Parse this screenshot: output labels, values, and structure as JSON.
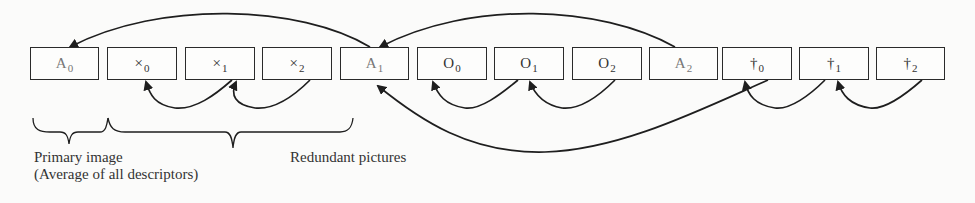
{
  "diagram": {
    "boxes": [
      {
        "id": "A0",
        "base": "A",
        "sub": "0",
        "left": 30
      },
      {
        "id": "x0",
        "base": "×",
        "sub": "0",
        "left": 107
      },
      {
        "id": "x1",
        "base": "×",
        "sub": "1",
        "left": 185
      },
      {
        "id": "x2",
        "base": "×",
        "sub": "2",
        "left": 262
      },
      {
        "id": "A1",
        "base": "A",
        "sub": "1",
        "left": 340
      },
      {
        "id": "o0",
        "base": "O",
        "sub": "0",
        "left": 417
      },
      {
        "id": "o1",
        "base": "O",
        "sub": "1",
        "left": 494
      },
      {
        "id": "o2",
        "base": "O",
        "sub": "2",
        "left": 572
      },
      {
        "id": "A2",
        "base": "A",
        "sub": "2",
        "left": 649
      },
      {
        "id": "t0",
        "base": "†",
        "sub": "0",
        "left": 726
      },
      {
        "id": "t1",
        "base": "†",
        "sub": "1",
        "left": 804
      },
      {
        "id": "t2",
        "base": "†",
        "sub": "2",
        "left": 876
      }
    ],
    "labels": {
      "primary_image": "Primary image",
      "primary_image_note": "(Average of all descriptors)",
      "redundant_pictures": "Redundant pictures"
    },
    "edges": [
      {
        "from": "A1",
        "to": "A0",
        "side": "top"
      },
      {
        "from": "A2",
        "to": "A1",
        "side": "top"
      },
      {
        "from": "x1",
        "to": "x0",
        "side": "bottom"
      },
      {
        "from": "x2",
        "to": "x1",
        "side": "bottom"
      },
      {
        "from": "o1",
        "to": "o0",
        "side": "bottom"
      },
      {
        "from": "o2",
        "to": "o1",
        "side": "bottom"
      },
      {
        "from": "t1",
        "to": "t0",
        "side": "bottom"
      },
      {
        "from": "t2",
        "to": "t1",
        "side": "bottom"
      },
      {
        "from": "t0",
        "to": "A1",
        "side": "bottom"
      }
    ]
  }
}
